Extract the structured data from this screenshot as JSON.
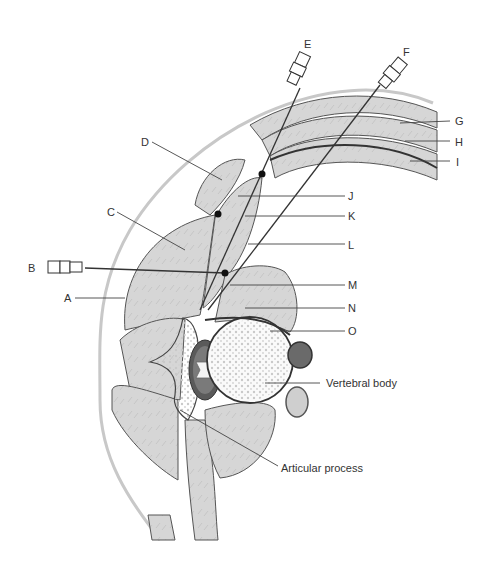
{
  "diagram": {
    "type": "anatomical cross-section",
    "labels": {
      "A": "A",
      "B": "B",
      "C": "C",
      "D": "D",
      "E": "E",
      "F": "F",
      "G": "G",
      "H": "H",
      "I": "I",
      "J": "J",
      "K": "K",
      "L": "L",
      "M": "M",
      "N": "N",
      "O": "O",
      "vertebral_body": "Vertebral body",
      "articular_process": "Articular process"
    },
    "needles": [
      "B",
      "E",
      "F"
    ],
    "colors": {
      "muscle": "#d4d4d4",
      "bone": "#f2f2f2",
      "outline": "#444444",
      "skin": "#c8c8c8",
      "vessel_dark": "#6a6a6a",
      "vessel_light": "#cfcfcf",
      "needle_tip": "#111111"
    }
  }
}
